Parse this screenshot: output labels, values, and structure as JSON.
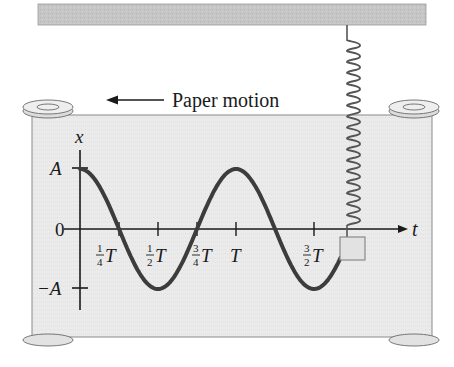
{
  "figure": {
    "caption_label": "Paper motion",
    "colors": {
      "ceiling": "#c4c4c4",
      "paper": "#ebebeb",
      "curve": "#3c3c3c",
      "axis": "#1a1a1a",
      "spring": "#555555",
      "mass": "#e2e2e2",
      "roller": "#e6e6e6"
    },
    "axes": {
      "y_label": "x",
      "x_label": "t",
      "y_ticks": [
        {
          "label": "A",
          "value": 1
        },
        {
          "label": "0",
          "value": 0
        },
        {
          "label": "−A",
          "value": -1
        }
      ],
      "x_ticks": [
        {
          "num": "1",
          "den": "4",
          "sym": "T",
          "value": 0.25
        },
        {
          "num": "1",
          "den": "2",
          "sym": "T",
          "value": 0.5
        },
        {
          "num": "3",
          "den": "4",
          "sym": "T",
          "value": 0.75
        },
        {
          "num": "",
          "den": "",
          "sym": "T",
          "value": 1.0
        },
        {
          "num": "3",
          "den": "2",
          "sym": "T",
          "value": 1.5
        }
      ]
    },
    "curve": {
      "function": "x = A cos(2π t / T)",
      "t_range_periods": [
        0,
        1.67
      ]
    }
  }
}
